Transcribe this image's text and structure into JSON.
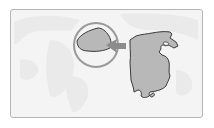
{
  "map": {
    "title": "Location map",
    "colors": {
      "background": "#f4f4f4",
      "land_faint": "#eaeaea",
      "highlight_fill": "#b8b8b8",
      "outline": "#3a3a3a",
      "circle_stroke": "#9a9a9a",
      "arrow": "#8c8c8c",
      "frame_border": "#b5b5b5"
    },
    "elements": {
      "highlight_circle": {
        "cx": 96,
        "cy": 45,
        "r": 22
      },
      "inset_region": "small highlighted region",
      "main_region": "country outline (China-like)",
      "arrow_direction": "left"
    }
  }
}
